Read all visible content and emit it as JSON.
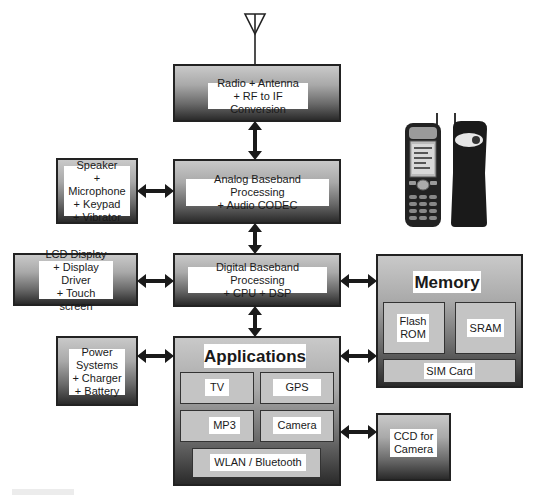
{
  "diagram": {
    "type": "block-diagram",
    "blocks": {
      "radio": {
        "label": "Radio + Antenna\n+ RF to IF Conversion"
      },
      "analog": {
        "label": "Analog Baseband Processing\n+ Audio CODEC"
      },
      "speaker": {
        "label": "Speaker\n+ Microphone\n+ Keypad\n+ Vibrator"
      },
      "lcd": {
        "label": "LCD Display\n+ Display Driver\n+ Touch screen"
      },
      "digital": {
        "label": "Digital Baseband Processing\n+ CPU + DSP"
      },
      "memory": {
        "title": "Memory",
        "flash": "Flash\nROM",
        "sram": "SRAM",
        "sim": "SIM Card"
      },
      "power": {
        "label": "Power\nSystems\n+ Charger\n+ Battery"
      },
      "applications": {
        "title": "Applications",
        "tv": "TV",
        "gps": "GPS",
        "mp3": "MP3",
        "camera": "Camera",
        "wlan": "WLAN / Bluetooth"
      },
      "ccd": {
        "label": "CCD for\nCamera"
      }
    },
    "connections": [
      [
        "antenna",
        "radio"
      ],
      [
        "radio",
        "analog"
      ],
      [
        "speaker",
        "analog"
      ],
      [
        "analog",
        "digital"
      ],
      [
        "lcd",
        "digital"
      ],
      [
        "digital",
        "memory"
      ],
      [
        "digital",
        "applications"
      ],
      [
        "power",
        "applications"
      ],
      [
        "applications",
        "memory"
      ],
      [
        "applications",
        "ccd"
      ]
    ],
    "images": {
      "phone_front": "phone-front-image",
      "phone_back": "phone-back-image"
    }
  }
}
